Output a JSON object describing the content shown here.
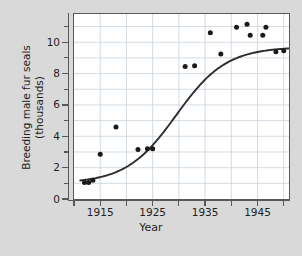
{
  "chart_data": {
    "type": "scatter",
    "title": "",
    "xlabel": "Year",
    "ylabel_line1": "Breeding male fur seals",
    "ylabel_line2": "(thousands)",
    "xlim": [
      1910,
      1951
    ],
    "ylim": [
      0,
      11.8
    ],
    "x_major_ticks": [
      1915,
      1925,
      1935,
      1945
    ],
    "x_minor_ticks": [
      1910,
      1920,
      1930,
      1940,
      1950
    ],
    "x_tick_labels": [
      "1915",
      "1925",
      "1935",
      "1945"
    ],
    "y_major_ticks": [
      0,
      2,
      4,
      6,
      8,
      10
    ],
    "y_minor_ticks": [
      1,
      3,
      5,
      7,
      9,
      11
    ],
    "y_tick_labels": [
      "0",
      "2",
      "4",
      "6",
      "8",
      "10"
    ],
    "grid": true,
    "grid_color": "#c8d2dc",
    "legend": "none",
    "marker_color": "#1a1a1a",
    "line_color": "#2d2d2d",
    "plot_background": "#ffffff",
    "figure_background": "#d9d9d9",
    "points": [
      {
        "x": 1912.0,
        "y": 1.05
      },
      {
        "x": 1912.8,
        "y": 1.05
      },
      {
        "x": 1913.6,
        "y": 1.2
      },
      {
        "x": 1915.0,
        "y": 2.85
      },
      {
        "x": 1918.0,
        "y": 4.6
      },
      {
        "x": 1922.2,
        "y": 3.15
      },
      {
        "x": 1924.0,
        "y": 3.2
      },
      {
        "x": 1925.0,
        "y": 3.2
      },
      {
        "x": 1931.2,
        "y": 8.45
      },
      {
        "x": 1933.0,
        "y": 8.5
      },
      {
        "x": 1936.0,
        "y": 10.6
      },
      {
        "x": 1938.0,
        "y": 9.25
      },
      {
        "x": 1941.0,
        "y": 10.95
      },
      {
        "x": 1943.0,
        "y": 11.15
      },
      {
        "x": 1943.6,
        "y": 10.45
      },
      {
        "x": 1946.0,
        "y": 10.45
      },
      {
        "x": 1946.6,
        "y": 10.95
      },
      {
        "x": 1948.5,
        "y": 9.4
      },
      {
        "x": 1950.0,
        "y": 9.45
      }
    ],
    "fit_curve": {
      "name": "logistic fit",
      "asymptote": 9.7,
      "midpoint_year": 1929.5,
      "lower_value": 1.0,
      "growth_rate": 0.21
    }
  }
}
